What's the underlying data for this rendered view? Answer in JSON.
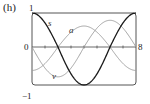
{
  "panel_label": "(h)",
  "chart_data": {
    "type": "line",
    "title": "",
    "xlabel": "",
    "ylabel": "",
    "xlim": [
      0,
      8
    ],
    "ylim": [
      -1,
      1
    ],
    "grid": false,
    "tick_labels": {
      "y_top": "1",
      "y_bottom": "−1",
      "x_origin": "0",
      "x_end": "8"
    },
    "x_ticks": [
      0,
      1,
      2,
      3,
      4,
      5,
      6,
      7,
      8
    ],
    "series": [
      {
        "name": "s",
        "formula": "cos(πt/4)",
        "color": "#1a1a1a",
        "x": [
          0,
          1,
          2,
          3,
          4,
          5,
          6,
          7,
          8
        ],
        "values": [
          1,
          0.707,
          0,
          -0.707,
          -1,
          -0.707,
          0,
          0.707,
          1
        ]
      },
      {
        "name": "v",
        "formula": "-(π/4) sin(πt/4)",
        "color": "#9a9a9a",
        "x": [
          0,
          1,
          2,
          3,
          4,
          5,
          6,
          7,
          8
        ],
        "values": [
          0,
          -0.555,
          -0.785,
          -0.555,
          0,
          0.555,
          0.785,
          0.555,
          0
        ]
      },
      {
        "name": "a",
        "formula": "-(π/4)^2 cos(πt/4)",
        "color": "#9a9a9a",
        "x": [
          0,
          1,
          2,
          3,
          4,
          5,
          6,
          7,
          8
        ],
        "values": [
          -0.617,
          -0.436,
          0,
          0.436,
          0.617,
          0.436,
          0,
          -0.436,
          -0.617
        ]
      }
    ],
    "curve_labels": {
      "s": "s",
      "a": "a",
      "v": "v"
    }
  }
}
